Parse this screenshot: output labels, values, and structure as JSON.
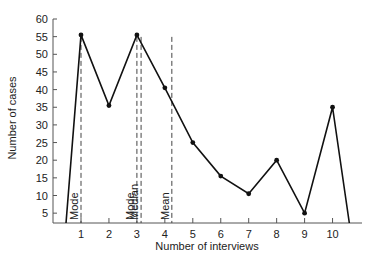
{
  "chart_data": {
    "type": "line",
    "title": "",
    "xlabel": "Number of interviews",
    "ylabel": "Number of cases",
    "x": [
      1,
      2,
      3,
      4,
      5,
      6,
      7,
      8,
      9,
      10
    ],
    "values": [
      55.5,
      35.5,
      55.5,
      40.5,
      25,
      15.5,
      10.5,
      20,
      5,
      35
    ],
    "line_start": {
      "x": 0.5,
      "y": 2.5
    },
    "line_end": {
      "x": 10.6,
      "y": 2.5
    },
    "xticks": [
      1,
      2,
      3,
      4,
      5,
      6,
      7,
      8,
      9,
      10
    ],
    "yticks": [
      5,
      10,
      15,
      20,
      25,
      30,
      35,
      40,
      45,
      50,
      55,
      60
    ],
    "ylim": [
      2.5,
      60
    ],
    "xlim": [
      0,
      11
    ],
    "grid": false,
    "annotations": [
      {
        "label": "Mode",
        "x": 1.0,
        "style": "dashed-vertical"
      },
      {
        "label": "Mode",
        "x": 3.0,
        "style": "dashed-vertical"
      },
      {
        "label": "Median",
        "x": 3.15,
        "style": "dashed-vertical"
      },
      {
        "label": "Mean",
        "x": 4.25,
        "style": "dashed-vertical"
      }
    ]
  },
  "colors": {
    "line": "#111111",
    "axis": "#555555",
    "text": "#222222"
  }
}
